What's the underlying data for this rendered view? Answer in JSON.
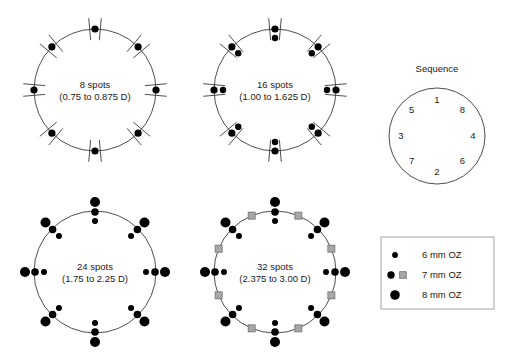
{
  "figure": {
    "width": 505,
    "height": 363,
    "background": "#ffffff",
    "line_color": "#3a3a3a",
    "dot_color": "#000000",
    "square_fill": "#a8a8a8",
    "square_stroke": "#6e6e6e",
    "text_color": "#1a1a1a"
  },
  "chart_data": {
    "type": "scatter",
    "title": "",
    "legend_position": "bottom-right",
    "panels": [
      {
        "id": "panel-8-spots",
        "label_line1": "8 spots",
        "label_line2": "(0.75 to 0.875 D)",
        "center_x": 95,
        "center_y": 90,
        "radius": 61,
        "has_ticks": true,
        "tick_half_length": 11,
        "angles_deg": [
          90,
          45,
          0,
          -45,
          -90,
          -135,
          180,
          135
        ],
        "clusters": [
          {
            "offset": 0,
            "size": "6mm",
            "shape": "dot",
            "r": 3.6
          }
        ]
      },
      {
        "id": "panel-16-spots",
        "label_line1": "16 spots",
        "label_line2": "(1.00 to 1.625 D)",
        "center_x": 275,
        "center_y": 90,
        "radius": 61,
        "has_ticks": true,
        "tick_half_length": 11,
        "angles_deg": [
          90,
          45,
          0,
          -45,
          -90,
          -135,
          180,
          135
        ],
        "clusters": [
          {
            "offset": 0,
            "size": "6mm",
            "shape": "dot",
            "r": 3.6
          },
          {
            "offset": -9,
            "size": "6mm",
            "shape": "dot",
            "r": 3.2
          }
        ]
      },
      {
        "id": "panel-24-spots",
        "label_line1": "24 spots",
        "label_line2": "(1.75 to 2.25 D)",
        "center_x": 95,
        "center_y": 272,
        "radius": 61,
        "has_ticks": false,
        "tick_half_length": 0,
        "angles_deg": [
          90,
          45,
          0,
          -45,
          -90,
          -135,
          180,
          135
        ],
        "clusters": [
          {
            "offset": -10,
            "size": "6mm",
            "shape": "dot",
            "r": 3.0
          },
          {
            "offset": -1,
            "size": "7mm",
            "shape": "dot",
            "r": 3.8
          },
          {
            "offset": 9,
            "size": "8mm",
            "shape": "dot",
            "r": 5.0
          }
        ]
      },
      {
        "id": "panel-32-spots",
        "label_line1": "32 spots",
        "label_line2": "(2.375 to 3.00 D)",
        "center_x": 275,
        "center_y": 272,
        "radius": 61,
        "has_ticks": false,
        "tick_half_length": 0,
        "angles_deg": [
          90,
          45,
          0,
          -45,
          -90,
          -135,
          180,
          135
        ],
        "clusters": [
          {
            "offset": -10,
            "size": "6mm",
            "shape": "dot",
            "r": 3.0
          },
          {
            "offset": -1,
            "size": "7mm",
            "shape": "dot",
            "r": 3.8
          },
          {
            "offset": 9,
            "size": "8mm",
            "shape": "dot",
            "r": 5.0
          }
        ],
        "square_angles_deg": [
          67.5,
          22.5,
          -22.5,
          -67.5,
          -112.5,
          -157.5,
          157.5,
          112.5
        ],
        "square_size": 7.0
      }
    ],
    "sequence": {
      "id": "panel-sequence",
      "title": "Sequence",
      "center_x": 437,
      "center_y": 136,
      "radius": 48,
      "title_x": 437,
      "title_y": 72,
      "label_radius": 36,
      "positions": [
        {
          "number": "1",
          "angle_deg": 90
        },
        {
          "number": "8",
          "angle_deg": 45
        },
        {
          "number": "4",
          "angle_deg": 0
        },
        {
          "number": "6",
          "angle_deg": -45
        },
        {
          "number": "2",
          "angle_deg": -90
        },
        {
          "number": "7",
          "angle_deg": -135
        },
        {
          "number": "3",
          "angle_deg": 180
        },
        {
          "number": "5",
          "angle_deg": 135
        }
      ]
    },
    "legend": {
      "id": "legend-box",
      "x": 381,
      "y": 237,
      "width": 113,
      "height": 72,
      "entries": [
        {
          "label": "6 mm OZ",
          "marker": "dot",
          "dot_r": 2.9,
          "has_square": false
        },
        {
          "label": "7 mm OZ",
          "marker": "dot-square",
          "dot_r": 3.7,
          "has_square": true,
          "square_size": 6.6
        },
        {
          "label": "8 mm OZ",
          "marker": "dot",
          "dot_r": 4.8,
          "has_square": false
        }
      ]
    }
  }
}
